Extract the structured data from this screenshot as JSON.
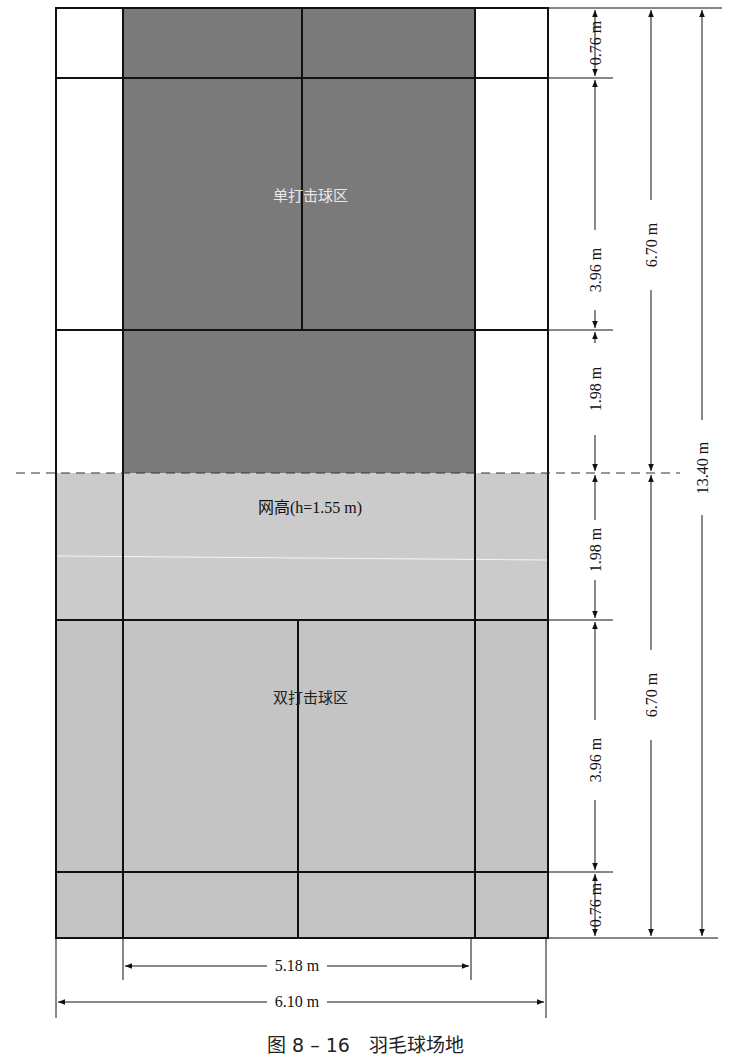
{
  "figure": {
    "caption": "图 8 – 16　羽毛球场地",
    "colors": {
      "singles_zone": "#7a7a7a",
      "doubles_zone": "#c4c4c4",
      "net_zone": "#cbcbcb",
      "lines": "#111111",
      "background": "#ffffff"
    }
  },
  "court": {
    "labels": {
      "singles_zone": "单打击球区",
      "net": "网高(h=1.55 m)",
      "doubles_zone": "双打击球区"
    }
  },
  "dimensions": {
    "right": {
      "top_back": "0.76 m",
      "top_service": "3.96 m",
      "top_front": "1.98 m",
      "bottom_front": "1.98 m",
      "bottom_service": "3.96 m",
      "bottom_back": "0.76 m",
      "half_top": "6.70 m",
      "half_bottom": "6.70 m",
      "total_length": "13.40 m"
    },
    "bottom": {
      "singles_width": "5.18 m",
      "doubles_width": "6.10 m"
    }
  }
}
